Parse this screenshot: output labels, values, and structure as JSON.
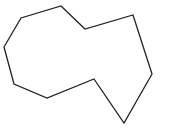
{
  "figure": {
    "type": "polygon",
    "stroke_color": "#222222",
    "fill_color": "none",
    "stroke_width": 1.3,
    "vertices": [
      [
        61,
        6
      ],
      [
        85,
        29
      ],
      [
        133,
        15
      ],
      [
        152,
        74
      ],
      [
        124,
        123
      ],
      [
        94,
        79
      ],
      [
        47,
        98
      ],
      [
        14,
        84
      ],
      [
        4,
        47
      ],
      [
        21,
        18
      ]
    ]
  }
}
